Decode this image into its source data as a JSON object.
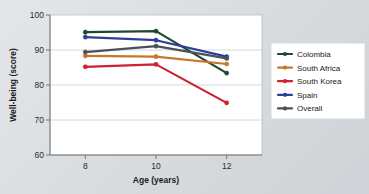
{
  "chart_data": {
    "type": "line",
    "title": "",
    "xlabel": "Age (years)",
    "ylabel": "Well-being (score)",
    "x": [
      8,
      10,
      12
    ],
    "xtick_labels": [
      "8",
      "10",
      "12"
    ],
    "ytick_labels": [
      "60",
      "70",
      "80",
      "90",
      "100"
    ],
    "yticks": [
      60,
      70,
      80,
      90,
      100
    ],
    "xlim": [
      7,
      13
    ],
    "ylim": [
      60,
      100
    ],
    "grid": "horizontal",
    "legend_position": "right",
    "series": [
      {
        "name": "Colombia",
        "color": "#1d4a2b",
        "values": [
          95.1,
          95.4,
          83.4
        ]
      },
      {
        "name": "South Africa",
        "color": "#c8762a",
        "values": [
          88.3,
          88.1,
          86.0
        ]
      },
      {
        "name": "South Korea",
        "color": "#cc2233",
        "values": [
          85.2,
          85.9,
          74.9
        ]
      },
      {
        "name": "Spain",
        "color": "#2e3d99",
        "values": [
          93.7,
          92.8,
          88.1
        ]
      },
      {
        "name": "Overall",
        "color": "#4a5157",
        "values": [
          89.4,
          91.1,
          87.6
        ]
      }
    ]
  },
  "figure": {
    "background": "#dcdfe2",
    "plot_background": "#ffffff",
    "legend_background": "#ffffff"
  }
}
